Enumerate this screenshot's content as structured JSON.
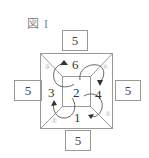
{
  "figure": {
    "title": "図 I",
    "side_values": {
      "top": "5",
      "left": "5",
      "right": "5",
      "bottom": "5"
    },
    "face_labels": {
      "top": "6",
      "left": "3",
      "center": "2",
      "right": "4",
      "bottom": "1"
    },
    "corner_labels": {
      "top_left": "③",
      "top_right": "④",
      "bottom_left": "②",
      "bottom_right": "①"
    },
    "colors": {
      "line": "#999999",
      "arrow": "#333333",
      "box_border": "#999999"
    }
  }
}
